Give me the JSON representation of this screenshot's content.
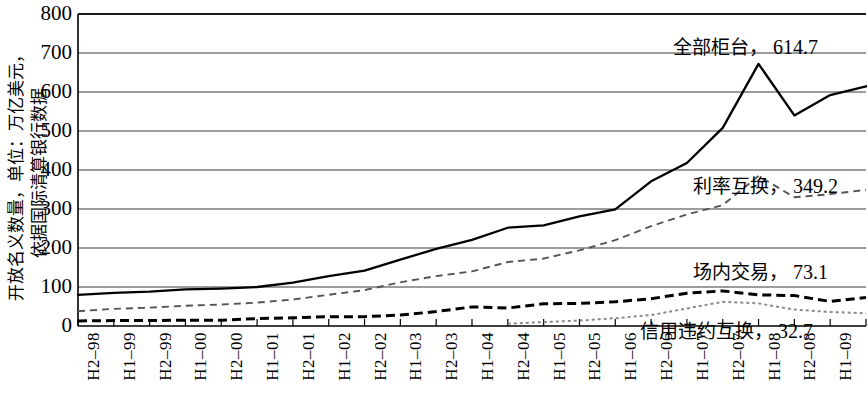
{
  "chart_data": {
    "type": "line",
    "title": "",
    "ylabel": "开放名义数量，单位：万亿美元，依据国际清算银行数据",
    "xlabel": "",
    "ylim": [
      0,
      800
    ],
    "yticks": [
      800,
      700,
      600,
      500,
      400,
      300,
      200,
      100,
      0
    ],
    "grid": true,
    "legend_position": "inline-annotations",
    "categories": [
      "H2-98",
      "H1-99",
      "H2-99",
      "H1-00",
      "H2-00",
      "H1-01",
      "H2-01",
      "H1-02",
      "H2-02",
      "H1-03",
      "H2-03",
      "H1-04",
      "H2-04",
      "H1-05",
      "H2-05",
      "H1-06",
      "H2-06",
      "H1-07",
      "H2-07",
      "H1-08",
      "H2-08",
      "H1-09",
      "H2-09"
    ],
    "series": [
      {
        "name": "全部柜台",
        "end_label": "全部柜台，614.7",
        "end_value": 614.7,
        "style": "solid-thick",
        "color": "#000000",
        "values": [
          80,
          85,
          88,
          94,
          96,
          100,
          111,
          128,
          142,
          170,
          198,
          221,
          252,
          258,
          281,
          299,
          371,
          418,
          508,
          672,
          540,
          592,
          614.7
        ]
      },
      {
        "name": "利率互换",
        "end_label": "利率互换，349.2",
        "end_value": 349.2,
        "style": "dashed-thin",
        "color": "#555555",
        "values": [
          38,
          44,
          47,
          52,
          55,
          60,
          68,
          80,
          92,
          112,
          128,
          140,
          164,
          173,
          194,
          220,
          256,
          286,
          310,
          385,
          330,
          338,
          349.2
        ]
      },
      {
        "name": "场内交易",
        "end_label": "场内交易，73.1",
        "end_value": 73.1,
        "style": "dashed-bold",
        "color": "#000000",
        "values": [
          13,
          14,
          14,
          15,
          15,
          19,
          21,
          24,
          24,
          28,
          37,
          49,
          46,
          57,
          58,
          62,
          70,
          84,
          90,
          80,
          78,
          63,
          73.1
        ]
      },
      {
        "name": "信用违约互换",
        "end_label": "信用违约互换，32.7",
        "end_value": 32.7,
        "style": "dotted-gray",
        "color": "#8a8a8a",
        "start_index": 12,
        "values": [
          null,
          null,
          null,
          null,
          null,
          null,
          null,
          null,
          null,
          null,
          null,
          null,
          6,
          10,
          14,
          20,
          28,
          45,
          62,
          58,
          42,
          36,
          32.7
        ]
      }
    ],
    "annotations": [
      {
        "id": "anno-all-otc",
        "text_cn": "全部柜台",
        "separator": "，",
        "value": "614.7",
        "x": 673,
        "y": 36
      },
      {
        "id": "anno-irs",
        "text_cn": "利率互换",
        "separator": "，",
        "value": "349.2",
        "x": 693,
        "y": 175
      },
      {
        "id": "anno-exchange",
        "text_cn": "场内交易",
        "separator": "，",
        "value": "73.1",
        "x": 693,
        "y": 261
      },
      {
        "id": "anno-cds",
        "text_cn": "信用违约互换",
        "separator": "，",
        "value": "32.7",
        "x": 640,
        "y": 320
      }
    ]
  },
  "ylabel_lines": {
    "line1": "开放名义数量，单位：万亿美元，",
    "line2": "依据国际清算银行数据"
  },
  "axis": {
    "yticks": [
      "800",
      "700",
      "600",
      "500",
      "400",
      "300",
      "200",
      "100",
      "0"
    ],
    "xlabels": [
      "H2–98",
      "H1–99",
      "H2–99",
      "H1–00",
      "H2–00",
      "H1–01",
      "H2–01",
      "H1–02",
      "H2–02",
      "H1–03",
      "H2–03",
      "H1–04",
      "H2–04",
      "H1–05",
      "H2–05",
      "H1–06",
      "H2–06",
      "H1–07",
      "H2–07",
      "H1–08",
      "H2–08",
      "H1–09",
      "H2–09"
    ]
  },
  "annotations": {
    "all_otc": "全部柜台，614.7",
    "irs": "利率互换，349.2",
    "exchange_traded": "场内交易，73.1",
    "cds": "信用违约互换，32.7"
  },
  "colors": {
    "axis": "#000000",
    "grid": "#3a3a3a",
    "series_solid": "#000000",
    "series_irs": "#555555",
    "series_exchange": "#000000",
    "series_cds": "#8a8a8a",
    "background": "#ffffff"
  }
}
